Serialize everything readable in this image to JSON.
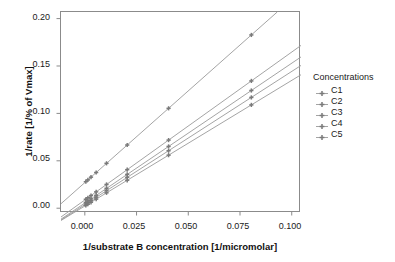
{
  "chart_data": {
    "type": "line",
    "title": "",
    "xlabel": "1/substrate B concentration [1/micromolar]",
    "ylabel": "1/rate [1/% of Vmax]",
    "xlim": [
      -0.012,
      0.104
    ],
    "ylim": [
      -0.004,
      0.208
    ],
    "xticks": [
      "0.000",
      "0.025",
      "0.050",
      "0.075",
      "0.100"
    ],
    "xtick_values": [
      0.0,
      0.025,
      0.05,
      0.075,
      0.1
    ],
    "yticks": [
      "0.00",
      "0.05",
      "0.10",
      "0.15",
      "0.20"
    ],
    "ytick_values": [
      0.0,
      0.05,
      0.1,
      0.15,
      0.2
    ],
    "grid": false,
    "legend_position": "right",
    "legend_title": "Concentrations",
    "line_color": "#9a9a9a",
    "marker_color": "#7a7a7a",
    "frame_color": "#8b8b8b",
    "x": [
      0.0,
      0.001,
      0.0025,
      0.005,
      0.01,
      0.02,
      0.04,
      0.08
    ],
    "series": [
      {
        "name": "C1",
        "intercept": 0.0105,
        "slope": 1.56,
        "values": [
          0.0105,
          0.0121,
          0.0144,
          0.0183,
          0.0261,
          0.0417,
          0.0729,
          0.1353
        ]
      },
      {
        "name": "C2",
        "intercept": 0.0072,
        "slope": 1.475,
        "values": [
          0.0072,
          0.0087,
          0.0109,
          0.0146,
          0.022,
          0.0367,
          0.0662,
          0.1252
        ]
      },
      {
        "name": "C3",
        "intercept": 0.0055,
        "slope": 1.405,
        "values": [
          0.0055,
          0.0069,
          0.009,
          0.0125,
          0.0196,
          0.0336,
          0.0617,
          0.1179
        ]
      },
      {
        "name": "C4",
        "intercept": 0.004,
        "slope": 1.325,
        "values": [
          0.004,
          0.0053,
          0.0073,
          0.0106,
          0.0173,
          0.0305,
          0.057,
          0.11
        ]
      },
      {
        "name": "C5",
        "intercept": 0.029,
        "slope": 1.935,
        "values": [
          0.029,
          0.0309,
          0.0338,
          0.0387,
          0.0484,
          0.0677,
          0.1064,
          0.1838
        ]
      }
    ],
    "legend_entries": [
      "C1",
      "C2",
      "C3",
      "C4",
      "C5"
    ]
  },
  "axes": {
    "x_title": "1/substrate B concentration [1/micromolar]",
    "y_title": "1/rate [1/% of Vmax]",
    "x_tick_labels": [
      "0.000",
      "0.025",
      "0.050",
      "0.075",
      "0.100"
    ],
    "y_tick_labels": [
      "0.00",
      "0.05",
      "0.10",
      "0.15",
      "0.20"
    ]
  },
  "legend": {
    "title": "Concentrations",
    "items": [
      {
        "label": "C1"
      },
      {
        "label": "C2"
      },
      {
        "label": "C3"
      },
      {
        "label": "C4"
      },
      {
        "label": "C5"
      }
    ]
  }
}
